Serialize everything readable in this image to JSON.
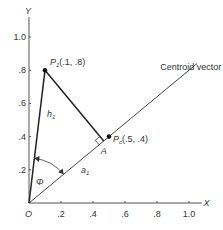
{
  "axes": {
    "x_label": "X",
    "y_label": "Y",
    "origin_label": "O",
    "x_ticks": [
      ".2",
      ".4",
      ".6",
      ".8",
      "1.0"
    ],
    "x_tick_values": [
      0.2,
      0.4,
      0.6,
      0.8,
      1.0
    ],
    "y_ticks": [
      ".2",
      ".4",
      ".6",
      ".8",
      "1.0"
    ],
    "y_tick_values": [
      0.2,
      0.4,
      0.6,
      0.8,
      1.0
    ],
    "range": [
      0,
      1.0
    ]
  },
  "points": {
    "p1": {
      "name": "P",
      "sub": "1",
      "coords": "(.1, .8)",
      "x": 0.1,
      "y": 0.8
    },
    "pc": {
      "name": "P",
      "sub": "c",
      "coords": "(.5, .4)",
      "x": 0.5,
      "y": 0.4
    }
  },
  "centroid_vector": {
    "label": "Centroid vector",
    "end_x": 1.05,
    "end_y": 0.84
  },
  "foot_label": "A",
  "h_label": {
    "name": "h",
    "sub": "1"
  },
  "a_label": {
    "name": "a",
    "sub": "1"
  },
  "angle_label": "Φ",
  "colors": {
    "ink": "#333333",
    "background": "#ffffff"
  }
}
